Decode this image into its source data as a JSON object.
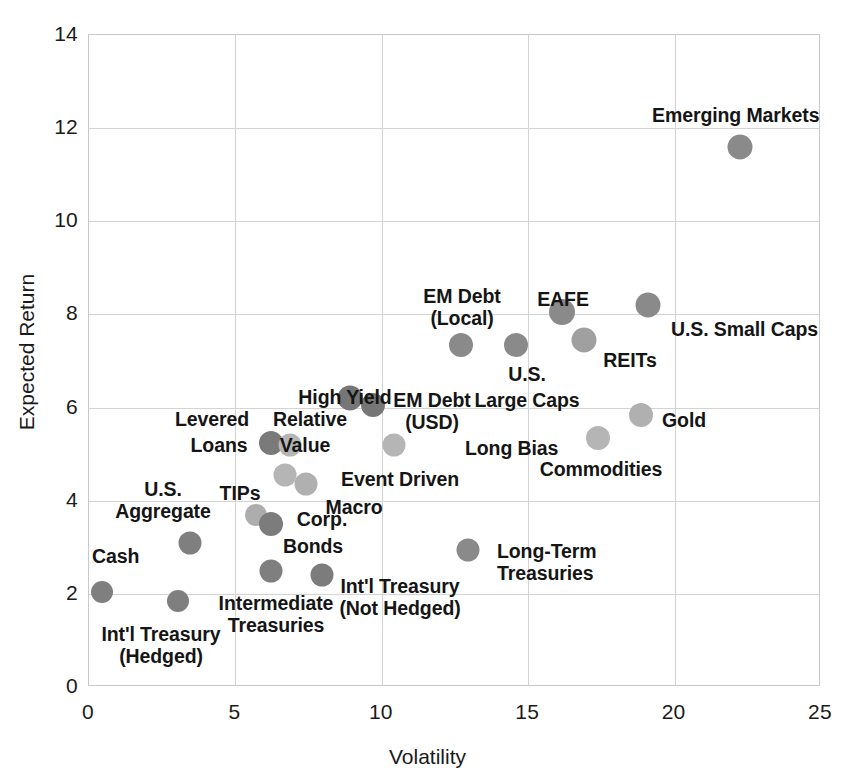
{
  "chart_data": {
    "type": "scatter",
    "title": "",
    "xlabel": "Volatility",
    "ylabel": "Expected Return",
    "xlim": [
      0,
      25
    ],
    "ylim": [
      0,
      14
    ],
    "xticks": [
      "0",
      "5",
      "10",
      "15",
      "20",
      "25"
    ],
    "yticks": [
      "0",
      "2",
      "4",
      "6",
      "8",
      "10",
      "12",
      "14"
    ],
    "grid": true,
    "legend": "none",
    "marker_colors": {
      "dark_gray": "#808080",
      "light_gray": "#b8b8b8"
    },
    "points": [
      {
        "label": "Cash",
        "x": 0.45,
        "y": 2.05,
        "color": "#7f7f7f",
        "r": 11
      },
      {
        "label": "Int'l Treasury\n(Hedged)",
        "x": 3.05,
        "y": 1.85,
        "color": "#7f7f7f",
        "r": 11
      },
      {
        "label": "U.S.\nAggregate",
        "x": 3.45,
        "y": 3.1,
        "color": "#7f7f7f",
        "r": 11.5
      },
      {
        "label": "TIPs",
        "x": 5.7,
        "y": 3.7,
        "color": "#adadad",
        "r": 11
      },
      {
        "label": "Corp.\nBonds",
        "x": 6.2,
        "y": 3.5,
        "color": "#7c7c7c",
        "r": 12
      },
      {
        "label": "Intermediate\nTreasuries",
        "x": 6.2,
        "y": 2.5,
        "color": "#7f7f7f",
        "r": 11.5
      },
      {
        "label": "Int'l Treasury\n(Not Hedged)",
        "x": 7.95,
        "y": 2.4,
        "color": "#7c7c7c",
        "r": 11.5
      },
      {
        "label": "Levered\nLoans",
        "x": 6.2,
        "y": 5.25,
        "color": "#7a7a7a",
        "r": 12
      },
      {
        "label": "Relative\nValue",
        "x": 6.85,
        "y": 5.2,
        "color": "#b5b5b5",
        "r": 11.5
      },
      {
        "label": "Macro",
        "x": 6.7,
        "y": 4.55,
        "color": "#b5b5b5",
        "r": 11.5
      },
      {
        "label": "Event Driven",
        "x": 7.4,
        "y": 4.35,
        "color": "#b0b0b0",
        "r": 11.5
      },
      {
        "label": "High Yield",
        "x": 8.9,
        "y": 6.2,
        "color": "#767676",
        "r": 12.5
      },
      {
        "label": "EM Debt\n(USD)",
        "x": 9.7,
        "y": 6.05,
        "color": "#767676",
        "r": 12
      },
      {
        "label": "Long Bias",
        "x": 10.4,
        "y": 5.2,
        "color": "#b5b5b5",
        "r": 11.5
      },
      {
        "label": "EM Debt\n(Local)",
        "x": 12.7,
        "y": 7.35,
        "color": "#8a8a8a",
        "r": 12
      },
      {
        "label": "Long-Term\nTreasuries",
        "x": 12.95,
        "y": 2.95,
        "color": "#8a8a8a",
        "r": 11.5
      },
      {
        "label": "U.S.\nLarge Caps",
        "x": 14.6,
        "y": 7.35,
        "color": "#8a8a8a",
        "r": 12
      },
      {
        "label": "EAFE",
        "x": 16.15,
        "y": 8.05,
        "color": "#8a8a8a",
        "r": 13
      },
      {
        "label": "REITs",
        "x": 16.9,
        "y": 7.45,
        "color": "#a0a0a0",
        "r": 12.5
      },
      {
        "label": "Commodities",
        "x": 17.4,
        "y": 5.35,
        "color": "#b5b5b5",
        "r": 12
      },
      {
        "label": "Gold",
        "x": 18.85,
        "y": 5.85,
        "color": "#b0b0b0",
        "r": 12
      },
      {
        "label": "U.S. Small Caps",
        "x": 19.1,
        "y": 8.2,
        "color": "#8a8a8a",
        "r": 12.5
      },
      {
        "label": "Emerging Markets",
        "x": 22.25,
        "y": 11.6,
        "color": "#8a8a8a",
        "r": 12.5
      }
    ]
  },
  "labels": [
    {
      "name": "cash",
      "text": "Cash",
      "left": 92,
      "top": 545,
      "align": "l"
    },
    {
      "name": "intl-treasury-hedged",
      "text": "Int'l Treasury\n(Hedged)",
      "left": 161,
      "top": 623,
      "align": "c"
    },
    {
      "name": "us-aggregate",
      "text": "U.S.\nAggregate",
      "left": 163,
      "top": 478,
      "align": "c"
    },
    {
      "name": "tips",
      "text": "TIPs",
      "left": 240,
      "top": 482,
      "align": "c"
    },
    {
      "name": "corp-bonds",
      "text": "Corp.",
      "left": 322,
      "top": 508,
      "align": "c"
    },
    {
      "name": "corp-bonds-2",
      "text": "Bonds",
      "left": 313,
      "top": 535,
      "align": "c"
    },
    {
      "name": "intermediate-treasuries",
      "text": "Intermediate\nTreasuries",
      "left": 276,
      "top": 592,
      "align": "c"
    },
    {
      "name": "intl-treasury-not-hedged",
      "text": "Int'l Treasury\n(Not Hedged)",
      "left": 400,
      "top": 575,
      "align": "c"
    },
    {
      "name": "levered-loans",
      "text": "Levered",
      "left": 212,
      "top": 408,
      "align": "c"
    },
    {
      "name": "levered-loans-2",
      "text": "Loans",
      "left": 219,
      "top": 434,
      "align": "c"
    },
    {
      "name": "relative-value",
      "text": "Relative",
      "left": 310,
      "top": 408,
      "align": "c"
    },
    {
      "name": "relative-value-2",
      "text": "Value",
      "left": 305,
      "top": 434,
      "align": "c"
    },
    {
      "name": "macro",
      "text": "Macro",
      "left": 354,
      "top": 496,
      "align": "c"
    },
    {
      "name": "event-driven",
      "text": "Event Driven",
      "left": 400,
      "top": 468,
      "align": "c"
    },
    {
      "name": "high-yield",
      "text": "High Yield",
      "left": 345,
      "top": 386,
      "align": "c"
    },
    {
      "name": "em-debt-usd",
      "text": "EM Debt\n(USD)",
      "left": 432,
      "top": 389,
      "align": "c"
    },
    {
      "name": "long-bias",
      "text": "Long Bias",
      "left": 465,
      "top": 437,
      "align": "l"
    },
    {
      "name": "em-debt-local",
      "text": "EM Debt\n(Local)",
      "left": 462,
      "top": 285,
      "align": "c"
    },
    {
      "name": "long-term-treasuries",
      "text": "Long-Term\nTreasuries",
      "left": 497,
      "top": 540,
      "align": "l"
    },
    {
      "name": "us-large-caps",
      "text": "U.S.",
      "left": 527,
      "top": 363,
      "align": "c"
    },
    {
      "name": "us-large-caps-2",
      "text": "Large Caps",
      "left": 527,
      "top": 389,
      "align": "c"
    },
    {
      "name": "eafe",
      "text": "EAFE",
      "left": 563,
      "top": 288,
      "align": "c"
    },
    {
      "name": "reits",
      "text": "REITs",
      "left": 630,
      "top": 349,
      "align": "c"
    },
    {
      "name": "commodities",
      "text": "Commodities",
      "left": 601,
      "top": 458,
      "align": "c"
    },
    {
      "name": "gold",
      "text": "Gold",
      "left": 662,
      "top": 409,
      "align": "l"
    },
    {
      "name": "us-small-caps",
      "text": "U.S. Small Caps",
      "left": 671,
      "top": 318,
      "align": "l"
    },
    {
      "name": "emerging-markets",
      "text": "Emerging Markets",
      "left": 652,
      "top": 104,
      "align": "l"
    }
  ]
}
